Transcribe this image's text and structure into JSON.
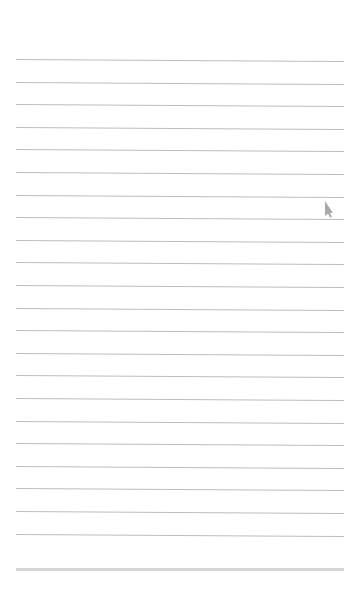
{
  "page": {
    "type": "lined-notepad-page",
    "background_color": "#ffffff",
    "rule_color": "#bdbdbd",
    "bottom_bar_color": "#d6d6d6",
    "rules": {
      "count": 22,
      "first_y": 59,
      "spacing": 22.6,
      "left": 16,
      "width": 328
    },
    "text_lines": [
      "",
      "",
      "",
      "",
      "",
      "",
      "",
      "",
      "",
      "",
      "",
      "",
      "",
      "",
      "",
      "",
      "",
      "",
      "",
      "",
      "",
      ""
    ]
  },
  "cursor": {
    "icon": "pointer-cursor-icon",
    "color": "#9a9a9a",
    "x": 323,
    "y": 200
  }
}
